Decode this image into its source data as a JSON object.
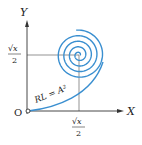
{
  "diagram": {
    "axes": {
      "x_label": "X",
      "y_label": "Y",
      "origin_label": "O"
    },
    "markers": {
      "x_tick_num": "√x",
      "x_tick_den": "2",
      "y_tick_num": "√x",
      "y_tick_den": "2"
    },
    "curve_label": "RL = A²",
    "colors": {
      "curve": "#3a8fd0",
      "axis": "#333333",
      "guide": "#555555"
    }
  }
}
